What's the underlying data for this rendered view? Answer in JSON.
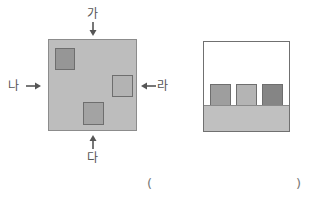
{
  "top_view": {
    "labels": {
      "top": "가",
      "left": "나",
      "bottom": "다",
      "right": "라"
    },
    "board_color": "#bdbdbd",
    "blocks": [
      {
        "name": "block-top-left",
        "color": "#969696"
      },
      {
        "name": "block-right",
        "color": "#b3b3b3"
      },
      {
        "name": "block-bottom",
        "color": "#a3a3a3"
      }
    ]
  },
  "front_view": {
    "base_color": "#c0c0c0",
    "blocks": [
      {
        "name": "block-left",
        "color": "#9e9e9e"
      },
      {
        "name": "block-middle",
        "color": "#b4b4b4"
      },
      {
        "name": "block-right",
        "color": "#858585"
      }
    ]
  },
  "answer": {
    "open": "(",
    "close": ")",
    "value": ""
  }
}
